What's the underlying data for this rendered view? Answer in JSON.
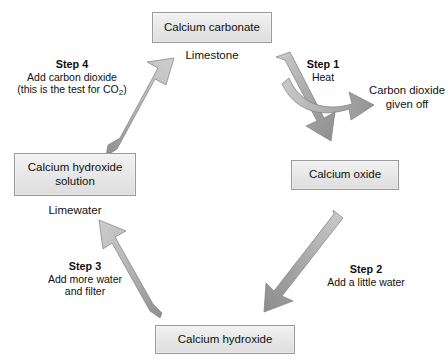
{
  "diagram": {
    "nodes": [
      {
        "id": "calcium-carbonate",
        "label": "Calcium carbonate",
        "sub_label": "Limestone"
      },
      {
        "id": "calcium-oxide",
        "label": "Calcium oxide",
        "sub_label": ""
      },
      {
        "id": "calcium-hydroxide",
        "label": "Calcium hydroxide",
        "sub_label": ""
      },
      {
        "id": "calcium-hydroxide-solution",
        "label": "Calcium hydroxide\nsolution",
        "label_line1": "Calcium hydroxide",
        "label_line2": "solution",
        "sub_label": "Limewater"
      }
    ],
    "steps": [
      {
        "id": "step-1",
        "title": "Step 1",
        "body_line1": "Heat",
        "body_line2": "",
        "body_line3": ""
      },
      {
        "id": "step-2",
        "title": "Step 2",
        "body_line1": "Add a little water",
        "body_line2": "",
        "body_line3": ""
      },
      {
        "id": "step-3",
        "title": "Step 3",
        "body_line1": "Add more water",
        "body_line2": "and filter",
        "body_line3": ""
      },
      {
        "id": "step-4",
        "title": "Step 4",
        "body_line1": "Add carbon dioxide",
        "body_line2": "(this is the test for CO",
        "body_line2_sub": "2",
        "body_line2_end": ")",
        "body_line3": ""
      }
    ],
    "annotations": [
      {
        "id": "carbon-dioxide-given-off",
        "line1": "Carbon dioxide",
        "line2": "given off"
      }
    ],
    "colors": {
      "box_fill_top": "#f2f2f2",
      "box_fill_bottom": "#dedede",
      "box_border": "#9a9a9a",
      "arrow_light": "#c3c3c3",
      "arrow_dark": "#8d8d8d",
      "text": "#101010",
      "background": "#ffffff"
    }
  }
}
